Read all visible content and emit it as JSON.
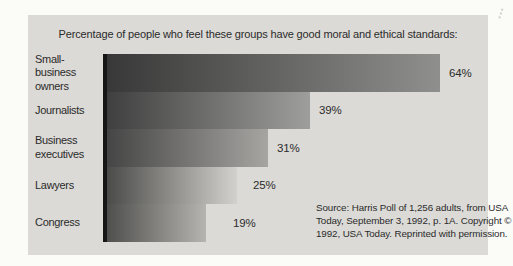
{
  "chart_data": {
    "type": "bar",
    "orientation": "horizontal",
    "title": "Percentage of people who feel these groups have good moral and ethical standards:",
    "categories": [
      "Small-business\nowners",
      "Journalists",
      "Business\nexecutives",
      "Lawyers",
      "Congress"
    ],
    "values": [
      64,
      39,
      31,
      25,
      19
    ],
    "value_labels": [
      "64%",
      "39%",
      "31%",
      "25%",
      "19%"
    ],
    "xlim": [
      0,
      70
    ],
    "grid": false,
    "legend": false,
    "bar_gradients": [
      {
        "from": "#383838",
        "to": "#8f8f8d"
      },
      {
        "from": "#3f3f3f",
        "to": "#9e9e9c"
      },
      {
        "from": "#454545",
        "to": "#a6a5a2"
      },
      {
        "from": "#4b4b49",
        "to": "#d2d1cd"
      },
      {
        "from": "#4f4f4d",
        "to": "#b5b4b0"
      }
    ],
    "source_note": "Source: Harris Poll of 1,256 adults, from USA\nToday, September 3, 1992, p. 1A. Copyright ©\n1992, USA Today. Reprinted with permission."
  },
  "colors": {
    "page_bg": "#fbfbf8",
    "panel_bg": "#dbdad6",
    "text": "#2b2b2b",
    "axis": "#161616"
  }
}
